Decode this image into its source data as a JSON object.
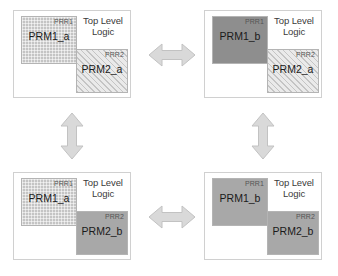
{
  "figure": {
    "type": "diagram",
    "toplevel_label": "Top Level\nLogic",
    "toplevel_label_line1": "Top Level",
    "toplevel_label_line2": "Logic",
    "colors": {
      "panel_border": "#d0d0d0",
      "block_border": "#b4b4b4",
      "block_fill_hatched": "#c4c4c4",
      "block_fill_light_hatched": "#eaeaea",
      "block_fill_solid_dark": "#8e8e8e",
      "block_fill_solid_mid": "#a8a8a8",
      "arrow_fill": "#d9d9d9",
      "arrow_stroke": "#c2c2c2",
      "text": "#1a1a1a",
      "tag_text": "#555555",
      "background": "#ffffff"
    }
  },
  "panels": [
    {
      "id": "top-left",
      "toplevel_line1": "Top Level",
      "toplevel_line2": "Logic",
      "blocks": [
        {
          "region": "PRR1",
          "module": "PRM1_a",
          "fill": "hatched-dense"
        },
        {
          "region": "PRR2",
          "module": "PRM2_a",
          "fill": "hatched-light"
        }
      ]
    },
    {
      "id": "top-right",
      "toplevel_line1": "Top Level",
      "toplevel_line2": "Logic",
      "blocks": [
        {
          "region": "PRR1",
          "module": "PRM1_b",
          "fill": "solid-dark"
        },
        {
          "region": "PRR2",
          "module": "PRM2_a",
          "fill": "hatched-light"
        }
      ]
    },
    {
      "id": "bottom-left",
      "toplevel_line1": "Top Level",
      "toplevel_line2": "Logic",
      "blocks": [
        {
          "region": "PRR1",
          "module": "PRM1_a",
          "fill": "hatched-dense"
        },
        {
          "region": "PRR2",
          "module": "PRM2_b",
          "fill": "solid-mid"
        }
      ]
    },
    {
      "id": "bottom-right",
      "toplevel_line1": "Top Level",
      "toplevel_line2": "Logic",
      "blocks": [
        {
          "region": "PRR1",
          "module": "PRM1_b",
          "fill": "solid-mid"
        },
        {
          "region": "PRR2",
          "module": "PRM2_b",
          "fill": "solid-mid"
        }
      ]
    }
  ],
  "arrows": [
    {
      "id": "top-horizontal",
      "direction": "bidirectional",
      "orientation": "horizontal",
      "connects": [
        "top-left",
        "top-right"
      ]
    },
    {
      "id": "bottom-horizontal",
      "direction": "bidirectional",
      "orientation": "horizontal",
      "connects": [
        "bottom-left",
        "bottom-right"
      ]
    },
    {
      "id": "left-vertical",
      "direction": "bidirectional",
      "orientation": "vertical",
      "connects": [
        "top-left",
        "bottom-left"
      ]
    },
    {
      "id": "right-vertical",
      "direction": "bidirectional",
      "orientation": "vertical",
      "connects": [
        "top-right",
        "bottom-right"
      ]
    }
  ]
}
